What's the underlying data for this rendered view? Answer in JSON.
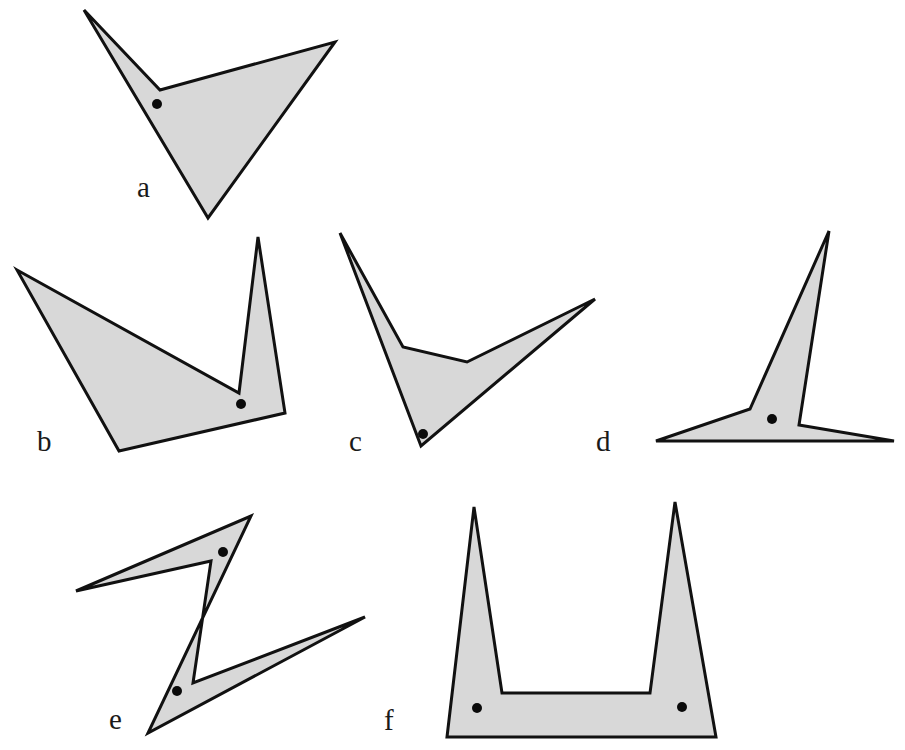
{
  "figure": {
    "fill_color": "#d8d8d8",
    "stroke_color": "#111111",
    "dot_color": "#0a0a0a",
    "shapes": [
      {
        "label": "a",
        "label_pos": [
          137,
          197
        ],
        "points": [
          [
            84,
            10
          ],
          [
            160,
            90
          ],
          [
            335,
            42
          ],
          [
            208,
            218
          ]
        ],
        "dots": [
          [
            157,
            104
          ]
        ]
      },
      {
        "label": "b",
        "label_pos": [
          37,
          451
        ],
        "points": [
          [
            17,
            270
          ],
          [
            239,
            393
          ],
          [
            258,
            237
          ],
          [
            285,
            413
          ],
          [
            119,
            451
          ]
        ],
        "dots": [
          [
            241,
            404
          ]
        ]
      },
      {
        "label": "c",
        "label_pos": [
          349,
          451
        ],
        "points": [
          [
            340,
            233
          ],
          [
            403,
            347
          ],
          [
            467,
            362
          ],
          [
            595,
            299
          ],
          [
            421,
            446
          ]
        ],
        "dots": [
          [
            423,
            434
          ]
        ]
      },
      {
        "label": "d",
        "label_pos": [
          596,
          451
        ],
        "points": [
          [
            656,
            441
          ],
          [
            750,
            409
          ],
          [
            829,
            231
          ],
          [
            799,
            425
          ],
          [
            894,
            441
          ]
        ],
        "dots": [
          [
            772,
            419
          ]
        ]
      },
      {
        "label": "e",
        "label_pos": [
          109,
          729
        ],
        "points": [
          [
            76,
            591
          ],
          [
            211,
            561
          ],
          [
            193,
            683
          ],
          [
            365,
            617
          ],
          [
            148,
            733
          ],
          [
            251,
            516
          ]
        ],
        "dots": [
          [
            223,
            552
          ],
          [
            177,
            691
          ]
        ]
      },
      {
        "label": "f",
        "label_pos": [
          384,
          730
        ],
        "points": [
          [
            447,
            737
          ],
          [
            474,
            507
          ],
          [
            502,
            693
          ],
          [
            650,
            693
          ],
          [
            675,
            502
          ],
          [
            716,
            737
          ]
        ],
        "dots": [
          [
            477,
            708
          ],
          [
            682,
            707
          ]
        ]
      }
    ]
  }
}
